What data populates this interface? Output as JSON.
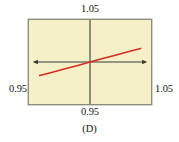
{
  "figure": {
    "caption": "(D)",
    "background_color": "#ffffff",
    "plot_background_color": "#f5f0c8",
    "plot_border_color": "#8d8d7c",
    "axis_color": "#3b3b34",
    "line_color": "#d42b22"
  },
  "labels": {
    "top": "1.05",
    "left": "0.95",
    "right": "1.05",
    "bottom": "0.95"
  },
  "chart_data": {
    "type": "line",
    "title": "",
    "subtitle": "",
    "xlabel": "",
    "ylabel": "",
    "grid": false,
    "legend": "none",
    "xlim": [
      0.95,
      1.05
    ],
    "ylim": [
      0.95,
      1.05
    ],
    "xticks": [
      0.95,
      1.05
    ],
    "xticklabels": [
      "0.95",
      "1.05"
    ],
    "yticks": [
      0.95,
      1.05
    ],
    "yticklabels": [
      "0.95",
      "1.05"
    ],
    "x_axis_position": 1.0,
    "y_axis_position": 1.0,
    "annotations": [
      "(D)"
    ],
    "series": [
      {
        "name": "curve",
        "color": "#d42b22",
        "x": [
          0.9552,
          1.0
        ],
        "y": [
          0.9838,
          1.0
        ],
        "x_full": [
          0.9552,
          0.9665,
          0.9778,
          0.9891,
          1.0,
          1.0113,
          1.0226,
          1.0339,
          1.0452
        ],
        "y_full": [
          0.9838,
          0.9878,
          0.9919,
          0.9959,
          1.0,
          1.0041,
          1.0081,
          1.0122,
          1.0162
        ]
      }
    ]
  }
}
